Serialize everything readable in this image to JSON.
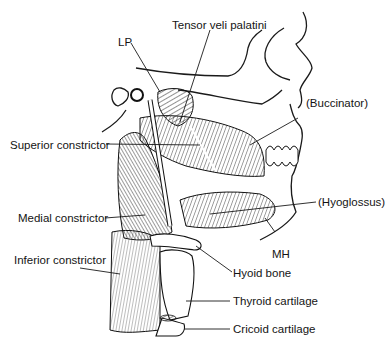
{
  "figure": {
    "labels": {
      "tensor_veli_palatini": "Tensor veli palatini",
      "lp": "LP",
      "buccinator": "(Buccinator)",
      "superior_constrictor": "Superior constrictor",
      "hyoglossus": "(Hyoglossus)",
      "medial_constrictor": "Medial constrictor",
      "mh": "MH",
      "inferior_constrictor": "Inferior constrictor",
      "hyoid_bone": "Hyoid bone",
      "thyroid_cartilage": "Thyroid cartilage",
      "cricoid_cartilage": "Cricoid cartilage"
    },
    "colors": {
      "ink": "#141414",
      "background": "#ffffff"
    }
  }
}
